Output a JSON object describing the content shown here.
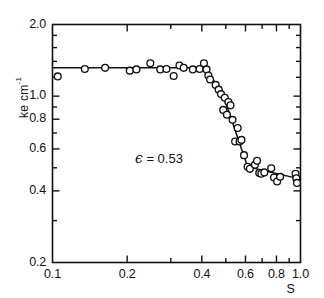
{
  "chart_data": {
    "type": "scatter",
    "title": "",
    "xlabel": "S",
    "ylabel": "ke  cm-1",
    "ylabel_base": "ke  cm",
    "ylabel_exp": "-1",
    "xscale": "log",
    "yscale": "log",
    "xlim": [
      0.1,
      1.0
    ],
    "ylim": [
      0.2,
      2.0
    ],
    "grid": false,
    "legend": null,
    "annotations": [
      {
        "text_symbol": "ϵ",
        "text": " = 0.53",
        "x": 0.215,
        "y": 0.545
      }
    ],
    "xticks": [
      {
        "value": 0.1,
        "label": "0.1",
        "major": true
      },
      {
        "value": 0.2,
        "label": "0.2",
        "major": true
      },
      {
        "value": 0.3,
        "label": "",
        "major": false
      },
      {
        "value": 0.4,
        "label": "0.4",
        "major": true
      },
      {
        "value": 0.5,
        "label": "",
        "major": false
      },
      {
        "value": 0.6,
        "label": "0.6",
        "major": true
      },
      {
        "value": 0.7,
        "label": "",
        "major": false
      },
      {
        "value": 0.8,
        "label": "0.8",
        "major": true
      },
      {
        "value": 0.9,
        "label": "",
        "major": false
      },
      {
        "value": 1.0,
        "label": "1.0",
        "major": true
      }
    ],
    "yticks": [
      {
        "value": 2.0,
        "label": "2.0",
        "major": true
      },
      {
        "value": 1.0,
        "label": "1.0",
        "major": true
      },
      {
        "value": 0.9,
        "label": "",
        "major": false
      },
      {
        "value": 0.8,
        "label": "0.8",
        "major": true
      },
      {
        "value": 0.7,
        "label": "",
        "major": false
      },
      {
        "value": 0.6,
        "label": "0.6",
        "major": true
      },
      {
        "value": 0.5,
        "label": "",
        "major": false
      },
      {
        "value": 0.4,
        "label": "0.4",
        "major": true
      },
      {
        "value": 0.3,
        "label": "",
        "major": false
      },
      {
        "value": 0.2,
        "label": "0.2",
        "major": true
      }
    ],
    "series": [
      {
        "name": "data",
        "marker": "open-circle",
        "points": [
          [
            0.105,
            1.21
          ],
          [
            0.135,
            1.3
          ],
          [
            0.163,
            1.315
          ],
          [
            0.205,
            1.28
          ],
          [
            0.218,
            1.295
          ],
          [
            0.248,
            1.375
          ],
          [
            0.272,
            1.295
          ],
          [
            0.288,
            1.3
          ],
          [
            0.308,
            1.215
          ],
          [
            0.325,
            1.345
          ],
          [
            0.338,
            1.315
          ],
          [
            0.368,
            1.295
          ],
          [
            0.392,
            1.3
          ],
          [
            0.408,
            1.375
          ],
          [
            0.418,
            1.295
          ],
          [
            0.425,
            1.22
          ],
          [
            0.432,
            1.175
          ],
          [
            0.455,
            1.115
          ],
          [
            0.468,
            1.065
          ],
          [
            0.478,
            1.02
          ],
          [
            0.488,
            0.875
          ],
          [
            0.495,
            0.985
          ],
          [
            0.505,
            0.835
          ],
          [
            0.512,
            0.945
          ],
          [
            0.522,
            0.915
          ],
          [
            0.532,
            0.795
          ],
          [
            0.545,
            0.645
          ],
          [
            0.558,
            0.735
          ],
          [
            0.568,
            0.645
          ],
          [
            0.578,
            0.655
          ],
          [
            0.592,
            0.565
          ],
          [
            0.612,
            0.505
          ],
          [
            0.625,
            0.495
          ],
          [
            0.655,
            0.515
          ],
          [
            0.668,
            0.535
          ],
          [
            0.682,
            0.475
          ],
          [
            0.695,
            0.472
          ],
          [
            0.715,
            0.478
          ],
          [
            0.762,
            0.498
          ],
          [
            0.782,
            0.455
          ],
          [
            0.805,
            0.438
          ],
          [
            0.828,
            0.458
          ],
          [
            0.955,
            0.472
          ],
          [
            0.962,
            0.452
          ],
          [
            0.968,
            0.432
          ]
        ]
      }
    ],
    "fit_line": {
      "name": "piecewise-fit",
      "points": [
        [
          0.1,
          1.315
        ],
        [
          0.42,
          1.315
        ],
        [
          0.5,
          0.935
        ],
        [
          0.612,
          0.505
        ],
        [
          1.0,
          0.448
        ]
      ]
    }
  }
}
